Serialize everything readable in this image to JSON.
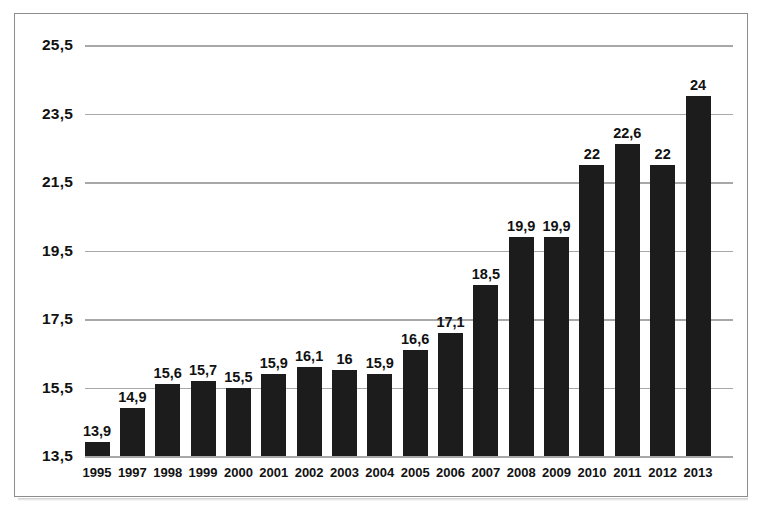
{
  "chart_data": {
    "type": "bar",
    "title": "",
    "xlabel": "",
    "ylabel": "",
    "categories": [
      "1995",
      "1997",
      "1998",
      "1999",
      "2000",
      "2001",
      "2002",
      "2003",
      "2004",
      "2005",
      "2006",
      "2007",
      "2008",
      "2009",
      "2010",
      "2011",
      "2012",
      "2013"
    ],
    "values": [
      13.9,
      14.9,
      15.6,
      15.7,
      15.5,
      15.9,
      16.1,
      16,
      15.9,
      16.6,
      17.1,
      18.5,
      19.9,
      19.9,
      22,
      22.6,
      22,
      24
    ],
    "value_labels": [
      "13,9",
      "14,9",
      "15,6",
      "15,7",
      "15,5",
      "15,9",
      "16,1",
      "16",
      "15,9",
      "16,6",
      "17,1",
      "18,5",
      "19,9",
      "19,9",
      "22",
      "22,6",
      "22",
      "24"
    ],
    "ylim": [
      13.5,
      25.5
    ],
    "baseline": 13.5,
    "yticks": [
      13.5,
      15.5,
      17.5,
      19.5,
      21.5,
      23.5,
      25.5
    ],
    "ytick_labels": [
      "13,5",
      "15,5",
      "17,5",
      "19,5",
      "21,5",
      "23,5",
      "25,5"
    ],
    "grid": true,
    "legend": "none",
    "decimal_separator": ",",
    "bar_color": "#1c1c1c",
    "gridline_color": "#a8a8a8",
    "text_color": "#111111",
    "frame_color": "#8d8d8d",
    "background_color": "#ffffff"
  }
}
